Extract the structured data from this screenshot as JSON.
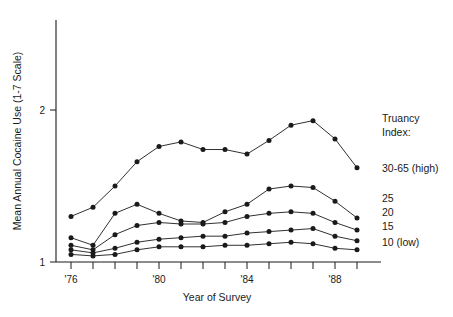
{
  "chart_data": {
    "type": "line",
    "title": "",
    "xlabel": "Year of Survey",
    "ylabel": "Mean Annual Cocaine Use (1-7 Scale)",
    "x": [
      "'76",
      "'77",
      "'78",
      "'79",
      "'80",
      "'81",
      "'82",
      "'83",
      "'84",
      "'85",
      "'86",
      "'87",
      "'88",
      "'89"
    ],
    "x_tick_labels_shown": [
      "'76",
      "'80",
      "'84",
      "'88"
    ],
    "y_tick_labels_shown": [
      "1",
      "2"
    ],
    "xlim": [
      "'76",
      "'89"
    ],
    "ylim": [
      1,
      2.35
    ],
    "grid": false,
    "legend_position": "right",
    "legend_title": "Truancy Index:",
    "series": [
      {
        "name": "30-65 (high)",
        "values": [
          1.3,
          1.36,
          1.5,
          1.66,
          1.76,
          1.79,
          1.74,
          1.74,
          1.71,
          1.8,
          1.9,
          1.93,
          1.81,
          1.62
        ]
      },
      {
        "name": "25",
        "values": [
          1.16,
          1.11,
          1.32,
          1.38,
          1.32,
          1.27,
          1.26,
          1.33,
          1.38,
          1.48,
          1.5,
          1.49,
          1.4,
          1.29
        ]
      },
      {
        "name": "20",
        "values": [
          1.11,
          1.08,
          1.18,
          1.24,
          1.26,
          1.25,
          1.25,
          1.26,
          1.3,
          1.32,
          1.33,
          1.32,
          1.26,
          1.21
        ]
      },
      {
        "name": "15",
        "values": [
          1.08,
          1.06,
          1.09,
          1.13,
          1.15,
          1.16,
          1.17,
          1.17,
          1.19,
          1.2,
          1.21,
          1.22,
          1.17,
          1.14
        ]
      },
      {
        "name": "10 (low)",
        "values": [
          1.05,
          1.04,
          1.05,
          1.08,
          1.1,
          1.1,
          1.1,
          1.11,
          1.11,
          1.12,
          1.13,
          1.12,
          1.09,
          1.08
        ]
      }
    ]
  },
  "axes": {
    "y_title": "Mean Annual Cocaine Use (1-7 Scale)",
    "x_title": "Year of Survey",
    "y_ticks": [
      {
        "label": "1",
        "value": 1
      },
      {
        "label": "2",
        "value": 2
      }
    ],
    "x_ticks": [
      {
        "label": "'76",
        "index": 0
      },
      {
        "label": "",
        "index": 1
      },
      {
        "label": "",
        "index": 2
      },
      {
        "label": "",
        "index": 3
      },
      {
        "label": "'80",
        "index": 4
      },
      {
        "label": "",
        "index": 5
      },
      {
        "label": "",
        "index": 6
      },
      {
        "label": "",
        "index": 7
      },
      {
        "label": "'84",
        "index": 8
      },
      {
        "label": "",
        "index": 9
      },
      {
        "label": "",
        "index": 10
      },
      {
        "label": "",
        "index": 11
      },
      {
        "label": "'88",
        "index": 12
      },
      {
        "label": "",
        "index": 13
      }
    ]
  },
  "legend": {
    "title_line_1": "Truancy",
    "title_line_2": "Index:",
    "entries": [
      {
        "label": "30-65 (high)"
      },
      {
        "label": "25"
      },
      {
        "label": "20"
      },
      {
        "label": "15"
      },
      {
        "label": "10 (low)"
      }
    ]
  },
  "style": {
    "ink": "#1a1a1a",
    "background": "#ffffff"
  }
}
